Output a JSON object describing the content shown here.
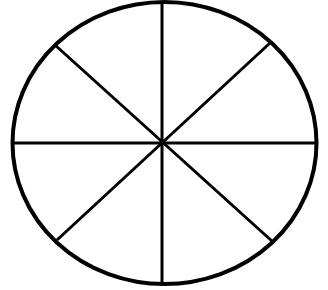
{
  "diagram": {
    "sections": 8,
    "stroke_color": "#000000",
    "background_color": "#ffffff",
    "outline": {
      "cx": 164.5,
      "cy": 143,
      "rx": 152,
      "ry": 141,
      "stroke_width": 4
    },
    "center": {
      "x": 162,
      "y": 143
    },
    "dividers": [
      {
        "name": "vertical",
        "x1": 162,
        "y1": 2,
        "x2": 162,
        "y2": 284
      },
      {
        "name": "horizontal",
        "x1": 13,
        "y1": 143,
        "x2": 316,
        "y2": 143
      },
      {
        "name": "diagonal-nw-se",
        "x1": 55,
        "y1": 45,
        "x2": 273,
        "y2": 242
      },
      {
        "name": "diagonal-ne-sw",
        "x1": 270,
        "y1": 43,
        "x2": 57,
        "y2": 240
      }
    ],
    "divider_stroke_width": 3
  }
}
